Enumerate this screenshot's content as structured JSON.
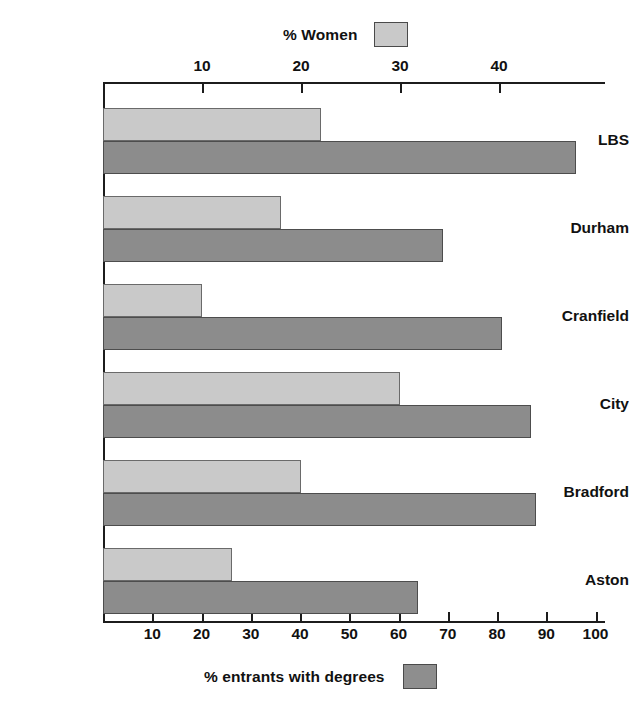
{
  "chart_data": {
    "type": "bar",
    "orientation": "horizontal",
    "title": "",
    "categories": [
      "LBS",
      "Durham",
      "Cranfield",
      "City",
      "Bradford",
      "Aston"
    ],
    "series": [
      {
        "name": "% Women",
        "axis": "top",
        "color": "#c9c9c9",
        "values": [
          22,
          18,
          10,
          30,
          20,
          13
        ]
      },
      {
        "name": "% entrants with degrees",
        "axis": "bottom",
        "color": "#8c8c8c",
        "values": [
          96,
          69,
          81,
          87,
          88,
          64
        ]
      }
    ],
    "top_axis": {
      "label": "% Women",
      "ticks": [
        10,
        20,
        30,
        40
      ],
      "range": [
        0,
        51
      ],
      "grid": false
    },
    "bottom_axis": {
      "label": "% entrants with degrees",
      "ticks": [
        10,
        20,
        30,
        40,
        50,
        60,
        70,
        80,
        90,
        100
      ],
      "range": [
        0,
        102
      ],
      "grid": false
    },
    "legend": [
      {
        "label": "% Women",
        "swatch": "light",
        "position": "top"
      },
      {
        "label": "% entrants with degrees",
        "swatch": "dark",
        "position": "bottom"
      }
    ]
  }
}
